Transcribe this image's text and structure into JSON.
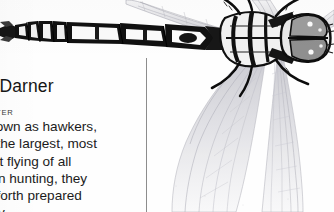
{
  "page": {
    "kind": "scanned-field-guide-page",
    "background_color": "#fefefe",
    "ink_color": "#161616",
    "rule_color": "#8d8d8d"
  },
  "article": {
    "headline": "ly, Darner",
    "headline_full_hint": "Dragonfly, Darner",
    "size_line": "WIDE",
    "habitat_line": "SH WATER",
    "body_lines": [
      "o known as hawkers,",
      "e of the largest, most",
      "d fast flying of all",
      "When hunting, they",
      "and forth prepared",
      "r prey."
    ]
  },
  "illustration": {
    "subject": "darner-dragonfly-dorsal-view",
    "orientation": "abdomen-left-head-right",
    "style": "black-and-white-engraving",
    "parts": {
      "abdomen": "segmented-banded-abdomen",
      "thorax": "striped-thorax",
      "head": "compound-eyes-head",
      "wings": "four-translucent-veined-wings",
      "legs": "six-spined-legs"
    },
    "wing_vein_color": "#c9c9cf",
    "body_ink": "#111111"
  },
  "column_rule": {
    "label": "column-divider"
  }
}
